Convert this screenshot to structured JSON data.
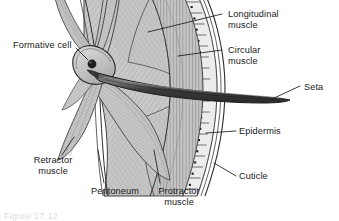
{
  "figure": {
    "caption_partial": "Figure 17.12"
  },
  "labels": {
    "formative_cell": "Formative cell",
    "longitudinal_muscle": "Longitudinal\nmuscle",
    "circular_muscle": "Circular\nmuscle",
    "seta": "Seta",
    "epidermis": "Epidermis",
    "cuticle": "Cuticle",
    "retractor_muscle": "Retractor\nmuscle",
    "peritoneum": "Peritoneum",
    "protractor_muscle": "Protractor\nmuscle"
  },
  "colors": {
    "ink": "#1a1a1a",
    "outline": "#2b2b2b",
    "muscle_fill": "#c9c9c9",
    "muscle_fill_dark": "#b6b6b6",
    "circular_fill": "#c2c2c2",
    "epidermis_fill": "#ececec",
    "cuticle_fill": "#dcdcdc",
    "seta_fill": "#3a3a3a",
    "seta_highlight": "#6e6e6e",
    "nucleus": "#1e1e1e",
    "background": "#ffffff"
  },
  "structures": [
    {
      "name": "formative-cell",
      "description": "bulbous cell at base of seta containing a dark nucleus"
    },
    {
      "name": "seta",
      "description": "long dark tapering chitinous bristle projecting outward through the body wall"
    },
    {
      "name": "longitudinal-muscle",
      "description": "inner muscle layer with herringbone striations"
    },
    {
      "name": "circular-muscle",
      "description": "vertical banded muscle layer outside longitudinal muscle"
    },
    {
      "name": "epidermis",
      "description": "single layer of columnar cells each with a nucleus dot"
    },
    {
      "name": "cuticle",
      "description": "thin outermost layer lines"
    },
    {
      "name": "retractor-muscle",
      "description": "muscle band running down-left from the seta base"
    },
    {
      "name": "protractor-muscle",
      "description": "muscle band running down-right from the seta base"
    },
    {
      "name": "peritoneum",
      "description": "thin membrane lining the inner surface of the body wall"
    }
  ],
  "label_positions": {
    "formative_cell": {
      "x": 13,
      "y": 41
    },
    "longitudinal_muscle": {
      "x": 228,
      "y": 10
    },
    "circular_muscle": {
      "x": 228,
      "y": 46
    },
    "seta": {
      "x": 304,
      "y": 84
    },
    "epidermis": {
      "x": 239,
      "y": 127
    },
    "cuticle": {
      "x": 239,
      "y": 172
    },
    "retractor_muscle": {
      "x": 17,
      "y": 156
    },
    "peritoneum": {
      "x": 84,
      "y": 187
    },
    "protractor_muscle": {
      "x": 148,
      "y": 187
    }
  }
}
